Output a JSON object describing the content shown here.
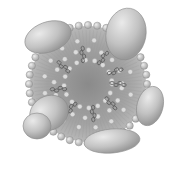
{
  "figure": {
    "colors": {
      "background": "#ffffff",
      "core_center": "#8a8a8a",
      "core_edge": "#b5b5b5",
      "phospholipid_head": "#d0d0d0",
      "phospholipid_outline": "#8c8c8c",
      "apolipoprotein": "#bdbdbd",
      "apolipoprotein_highlight": "#e6e6e6",
      "cholesterol": "#5a5a5a"
    },
    "core": {
      "cx": 88,
      "cy": 84,
      "r": 58
    },
    "apolipoproteins": [
      {
        "cx": 48,
        "cy": 37,
        "rx": 24,
        "ry": 15,
        "rot": -20
      },
      {
        "cx": 126,
        "cy": 34,
        "rx": 20,
        "ry": 26,
        "rot": 10
      },
      {
        "cx": 150,
        "cy": 106,
        "rx": 13,
        "ry": 20,
        "rot": 15
      },
      {
        "cx": 112,
        "cy": 141,
        "rx": 28,
        "ry": 12,
        "rot": -5
      },
      {
        "cx": 49,
        "cy": 113,
        "rx": 20,
        "ry": 17,
        "rot": -30
      },
      {
        "cx": 37,
        "cy": 126,
        "rx": 14,
        "ry": 13,
        "rot": 0
      }
    ],
    "cholesterol_angles": [
      0,
      40,
      80,
      125,
      170,
      215,
      260,
      300,
      335
    ]
  }
}
